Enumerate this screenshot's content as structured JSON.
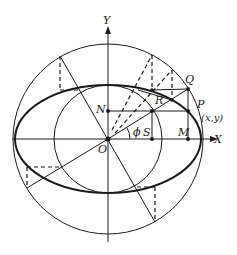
{
  "diagram": {
    "colors": {
      "stroke": "#1a1a1a",
      "background": "#ffffff"
    },
    "labels": {
      "y_axis": "Y",
      "x_axis": "X",
      "origin": "O",
      "N": "N",
      "Q": "Q",
      "P": "P",
      "P_coords": "(x,y)",
      "R": "R",
      "S": "S",
      "M": "M",
      "phi": "ϕ"
    },
    "elements": [
      "outer-circle",
      "inner-circle",
      "ellipse",
      "x-axis",
      "y-axis",
      "radius-OQ",
      "construction-lines",
      "dashed-projections"
    ]
  }
}
